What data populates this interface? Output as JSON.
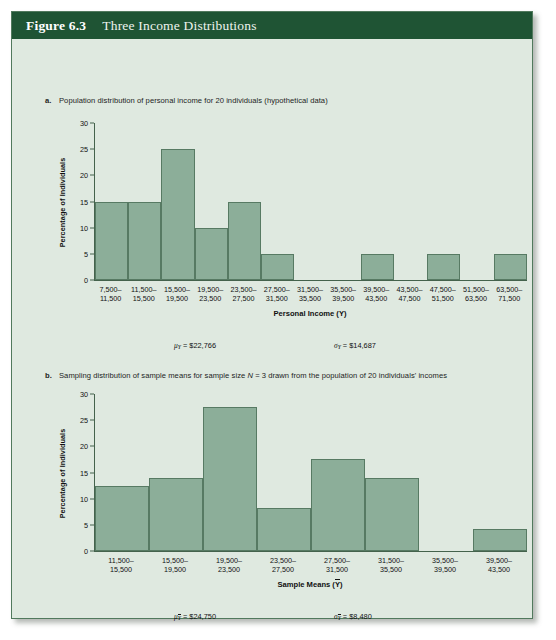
{
  "figure": {
    "number": "Figure 6.3",
    "title": "Three Income Distributions"
  },
  "panel_a": {
    "marker": "a.",
    "caption_part1": "Population distribution of personal income for 20 individuals (hypothetical data)",
    "axis_title": "Personal Income (Y)",
    "ylabel": "Percentage of Individuals",
    "mean_label": "μ",
    "mean_sub": "Y",
    "mean_value": "= $22,766",
    "sd_label": "σ",
    "sd_sub": "Y",
    "sd_value": "= $14,687"
  },
  "panel_b": {
    "marker": "b.",
    "caption_pre": "Sampling distribution of sample means for sample size ",
    "caption_em": "N",
    "caption_post": " = 3 drawn from the population of 20 individuals' incomes",
    "axis_title_pre": "Sample Means (",
    "axis_title_var": "Y",
    "axis_title_post": ")",
    "ylabel": "Percentage of Individuals",
    "mean_label": "μ",
    "mean_sub": "Y",
    "mean_value": "= $24,750",
    "sd_label": "σ",
    "sd_sub": "Y",
    "sd_value": "= $8,480"
  },
  "colors": {
    "header_green": "#1f5434",
    "panel_bg": "#dfe9e0",
    "bar_fill": "#8cae99",
    "bar_stroke": "#577a63",
    "axis": "#44624c"
  },
  "chart_data": [
    {
      "type": "bar",
      "id": "panel-a-histogram",
      "title": "Population distribution of personal income for 20 individuals (hypothetical data)",
      "xlabel": "Personal Income (Y)",
      "ylabel": "Percentage of Individuals",
      "ylim": [
        0,
        30
      ],
      "yticks": [
        0,
        5,
        10,
        15,
        20,
        25,
        30
      ],
      "grid": false,
      "legend": "none",
      "categories": [
        "7,500–\n11,500",
        "11,500–\n15,500",
        "15,500–\n19,500",
        "19,500–\n23,500",
        "23,500–\n27,500",
        "27,500–\n31,500",
        "31,500–\n35,500",
        "35,500–\n39,500",
        "39,500–\n43,500",
        "43,500–\n47,500",
        "47,500–\n51,500",
        "51,500–\n63,500",
        "63,500–\n71,500"
      ],
      "values": [
        15,
        15,
        25,
        10,
        15,
        5,
        0,
        0,
        5,
        0,
        5,
        0,
        5
      ],
      "annotations": [
        "μY = $22,766",
        "σY = $14,687"
      ]
    },
    {
      "type": "bar",
      "id": "panel-b-histogram",
      "title": "Sampling distribution of sample means for sample size N = 3 drawn from the population of 20 individuals' incomes",
      "xlabel": "Sample Means (Ȳ)",
      "ylabel": "Percentage of Individuals",
      "ylim": [
        0,
        30
      ],
      "yticks": [
        0,
        5,
        10,
        15,
        20,
        25,
        30
      ],
      "grid": false,
      "legend": "none",
      "categories": [
        "11,500–\n15,500",
        "15,500–\n19,500",
        "19,500–\n23,500",
        "23,500–\n27,500",
        "27,500–\n31,500",
        "31,500–\n35,500",
        "35,500–\n39,500",
        "39,500–\n43,500"
      ],
      "values": [
        12.5,
        14,
        27.5,
        8.3,
        17.5,
        14,
        0,
        4.2
      ],
      "annotations": [
        "μȲ = $24,750",
        "σȲ = $8,480"
      ]
    }
  ]
}
